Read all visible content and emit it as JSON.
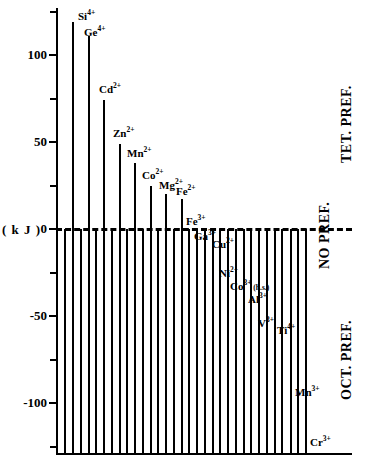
{
  "chart_data": {
    "type": "bar",
    "title": "",
    "xlabel": "",
    "ylabel": "( k J )",
    "ylim": [
      -137,
      127
    ],
    "grid": false,
    "legend": null,
    "orientation": "vertical",
    "zero_reference_line": true,
    "y_ticks_major": [
      100,
      50,
      0,
      -50,
      -100
    ],
    "y_ticks_major_labels": [
      "100",
      "50",
      "0",
      "-50",
      "-100"
    ],
    "y_ticks_minor": [
      125,
      75,
      25,
      -25,
      -75,
      -125
    ],
    "categories": [
      "Si 4+",
      "Ge 4+",
      "Cd 2+",
      "Zn 2+",
      "Mn 2+",
      "Co 2+",
      "Mg 2+",
      "Fe 2+",
      "Fe 3+",
      "Ga 3+",
      "Cu 2+",
      "Ni 2+",
      "Co 3+ (h.s.)",
      "Al 3+",
      "V 3+",
      "Ti 4+",
      "Mn 3+",
      "Cr 3+"
    ],
    "values": [
      119,
      111,
      74,
      49,
      38,
      25,
      20,
      17,
      0,
      -9,
      -13,
      -30,
      -35,
      -43,
      -57,
      -58,
      -99,
      -128
    ],
    "bars": [
      {
        "ion": "Si",
        "charge": "4+",
        "label": "Si",
        "sup": "4+",
        "value": 119,
        "x": 72,
        "label_x": 78,
        "label_y": 11
      },
      {
        "ion": "Ge",
        "charge": "4+",
        "label": "Ge",
        "sup": "4+",
        "value": 111,
        "x": 88,
        "label_x": 84,
        "label_y": 27
      },
      {
        "ion": "Cd",
        "charge": "2+",
        "label": "Cd",
        "sup": "2+",
        "value": 74,
        "x": 103,
        "label_x": 99,
        "label_y": 84
      },
      {
        "ion": "Zn",
        "charge": "2+",
        "label": "Zn",
        "sup": "2+",
        "value": 49,
        "x": 119,
        "label_x": 113,
        "label_y": 128
      },
      {
        "ion": "Mn",
        "charge": "2+",
        "label": "Mn",
        "sup": "2+",
        "value": 38,
        "x": 134,
        "label_x": 127,
        "label_y": 148
      },
      {
        "ion": "Co",
        "charge": "2+",
        "label": "Co",
        "sup": "2+",
        "value": 25,
        "x": 150,
        "label_x": 142,
        "label_y": 170
      },
      {
        "ion": "Mg",
        "charge": "2+",
        "label": "Mg",
        "sup": "2+",
        "value": 20,
        "x": 165,
        "label_x": 159,
        "label_y": 180
      },
      {
        "ion": "Fe",
        "charge": "2+",
        "label": "Fe",
        "sup": "2+",
        "value": 17,
        "x": 181,
        "label_x": 176,
        "label_y": 186
      },
      {
        "ion": "Fe",
        "charge": "3+",
        "label": "Fe",
        "sup": "3+",
        "value": 0,
        "x": 181,
        "label_x": 186,
        "label_y": 216
      },
      {
        "ion": "Ga",
        "charge": "3+",
        "label": "Ga",
        "sup": "3+",
        "value": -9,
        "x": 196,
        "label_x": 194,
        "label_y": 231
      },
      {
        "ion": "Cu",
        "charge": "2+",
        "label": "Cu",
        "sup": "2+",
        "value": -13,
        "x": 212,
        "label_x": 212,
        "label_y": 239
      },
      {
        "ion": "Ni",
        "charge": "2+",
        "label": "Ni",
        "sup": "2+",
        "value": -30,
        "x": 227,
        "label_x": 219,
        "label_y": 268
      },
      {
        "ion": "Co",
        "charge": "3+",
        "label": "Co",
        "sup": "3+",
        "suffix": " (h.s.)",
        "value": -35,
        "x": 243,
        "label_x": 230,
        "label_y": 281
      },
      {
        "ion": "Al",
        "charge": "3+",
        "label": "Al",
        "sup": "3+",
        "value": -43,
        "x": 258,
        "label_x": 248,
        "label_y": 294
      },
      {
        "ion": "V",
        "charge": "3+",
        "label": "V",
        "sup": "3+",
        "value": -57,
        "x": 274,
        "label_x": 258,
        "label_y": 318
      },
      {
        "ion": "Ti",
        "charge": "4+",
        "label": "Ti",
        "sup": "4+",
        "value": -58,
        "x": 274,
        "label_x": 277,
        "label_y": 325
      },
      {
        "ion": "Mn",
        "charge": "3+",
        "label": "Mn",
        "sup": "3+",
        "value": -99,
        "x": 290,
        "label_x": 295,
        "label_y": 387
      },
      {
        "ion": "Cr",
        "charge": "3+",
        "label": "Cr",
        "sup": "3+",
        "value": -128,
        "x": 305,
        "label_x": 310,
        "label_y": 437
      }
    ],
    "extra_bars_x": [
      64,
      80,
      95,
      111,
      126,
      142,
      157,
      173,
      188,
      204,
      219,
      235,
      250,
      266,
      281,
      297
    ],
    "region_labels": [
      {
        "key": "tet",
        "text": "TET. PREF.",
        "x": 339,
        "y": 163
      },
      {
        "key": "no",
        "text": "NO  PREF.",
        "x": 317,
        "y": 269
      },
      {
        "key": "oct",
        "text": "OCT. PREF.",
        "x": 339,
        "y": 400
      }
    ]
  },
  "axis": {
    "unit_label": "( k J )"
  }
}
